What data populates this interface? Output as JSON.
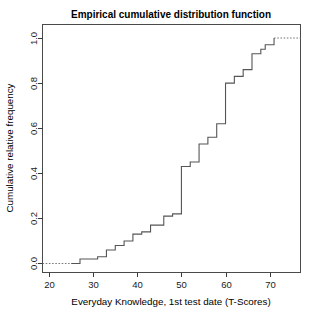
{
  "chart_data": {
    "type": "line",
    "subtype": "ecdf-step",
    "title": "Empirical cumulative distribution function",
    "xlabel": "Everyday Knowledge, 1st test date (T-Scores)",
    "ylabel": "Cumulative relative frequency",
    "xlim": [
      18.5,
      77.0
    ],
    "ylim": [
      -0.04,
      1.06
    ],
    "xticks": [
      20,
      30,
      40,
      50,
      60,
      70
    ],
    "xticklabels": [
      "20",
      "30",
      "40",
      "50",
      "60",
      "70"
    ],
    "yticks": [
      0.0,
      0.2,
      0.4,
      0.6,
      0.8,
      1.0
    ],
    "yticklabels": [
      "0.0",
      "0.2",
      "0.4",
      "0.6",
      "0.8",
      "1.0"
    ],
    "grid": false,
    "legend": null,
    "line_color": "#555555",
    "tail_color": "#777777",
    "frame_color": "#4a4a4a",
    "background": "#ffffff",
    "series": [
      {
        "name": "ECDF",
        "step_type": "hv",
        "x": [
          25,
          27,
          31,
          33,
          35,
          37,
          39,
          41,
          43,
          46,
          48,
          50,
          50,
          52,
          54,
          56,
          58,
          60,
          60,
          62,
          64,
          66,
          68,
          69,
          71
        ],
        "y": [
          0.0,
          0.02,
          0.03,
          0.06,
          0.08,
          0.1,
          0.13,
          0.14,
          0.17,
          0.21,
          0.22,
          0.24,
          0.43,
          0.45,
          0.53,
          0.56,
          0.62,
          0.62,
          0.8,
          0.83,
          0.86,
          0.93,
          0.95,
          0.97,
          1.0
        ],
        "left_tail_y": 0.0,
        "right_tail_y": 1.0,
        "left_tail_x_start": 18.5,
        "right_tail_x_end": 77.0
      }
    ],
    "annotations": []
  },
  "figure": {
    "width": 321,
    "height": 319
  }
}
